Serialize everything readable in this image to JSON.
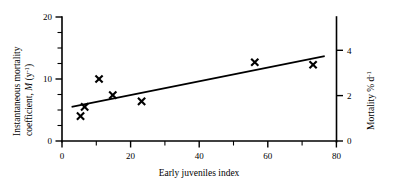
{
  "chart_data": {
    "type": "scatter",
    "title": "",
    "xlabel": "Early juveniles index",
    "ylabel": "Instantaneous mortality coefficient, M (y⁻¹)",
    "y2label": "Mortality % d⁻¹",
    "xlim": [
      0,
      80
    ],
    "ylim": [
      0,
      20
    ],
    "y2lim": [
      0,
      5.47
    ],
    "grid": false,
    "legend": null,
    "x_ticks_major": [
      0,
      20,
      40,
      60,
      80
    ],
    "x_ticks_major_labels": [
      "0",
      "20",
      "40",
      "60",
      "80"
    ],
    "x_ticks_minor": [
      10,
      30,
      50,
      70
    ],
    "y_ticks_major": [
      0,
      10,
      20
    ],
    "y_ticks_major_labels": [
      "0",
      "10",
      "20"
    ],
    "y_ticks_minor": [
      2.5,
      5,
      7.5,
      12.5,
      15,
      17.5
    ],
    "y2_ticks_major": [
      0,
      2,
      4
    ],
    "y2_ticks_major_labels": [
      "0",
      "2",
      "4"
    ],
    "marker_style": "x",
    "points": [
      {
        "x": 5.4,
        "y": 4.0
      },
      {
        "x": 6.6,
        "y": 5.5
      },
      {
        "x": 10.8,
        "y": 10.0
      },
      {
        "x": 14.8,
        "y": 7.4
      },
      {
        "x": 23.2,
        "y": 6.4
      },
      {
        "x": 56.2,
        "y": 12.7
      },
      {
        "x": 73.2,
        "y": 12.3
      }
    ],
    "fit_line": {
      "type": "linear-regression",
      "x_start": 2.8,
      "y_start": 5.5,
      "x_end": 76.6,
      "y_end": 13.7
    }
  },
  "axes": {
    "left_axis_name": "instantaneous-mortality-axis",
    "right_axis_name": "mortality-percent-axis",
    "bottom_axis_name": "early-juveniles-axis"
  }
}
